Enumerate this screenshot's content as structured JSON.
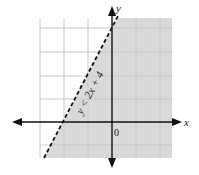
{
  "graph": {
    "inequality_label": "y < 2x + 4",
    "x_axis_label": "x",
    "y_axis_label": "y",
    "origin_label": "0",
    "boundary": {
      "slope": 2,
      "intercept": 4,
      "style": "dashed"
    },
    "shaded_region": "below/right of line",
    "colors": {
      "shade": "#d9d9d9",
      "grid": "#c8c8c8",
      "axis": "#111111",
      "line": "#111111"
    }
  }
}
